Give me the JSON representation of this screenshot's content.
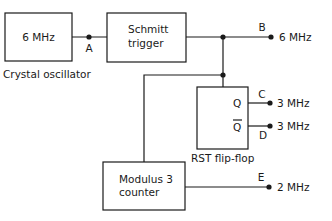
{
  "diagram": {
    "blocks": {
      "crystal": {
        "text": "6 MHz",
        "caption": "Crystal oscillator"
      },
      "schmitt": {
        "line1": "Schmitt",
        "line2": "trigger"
      },
      "flipflop": {
        "q": "Q",
        "qbar": "Q",
        "caption": "RST flip-flop"
      },
      "counter": {
        "line1": "Modulus 3",
        "line2": "counter"
      }
    },
    "nodes": {
      "a": {
        "label": "A"
      },
      "b": {
        "label": "B",
        "freq": "6 MHz"
      },
      "c": {
        "label": "C",
        "freq": "3 MHz"
      },
      "d": {
        "label": "D",
        "freq": "3 MHz"
      },
      "e": {
        "label": "E",
        "freq": "2 MHz"
      }
    },
    "colors": {
      "ink": "#1a1a1a",
      "background": "#ffffff"
    }
  }
}
